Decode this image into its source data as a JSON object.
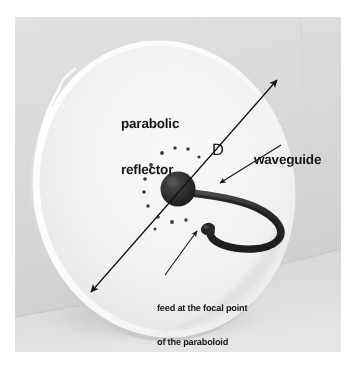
{
  "figure": {
    "kind": "photograph-with-annotations",
    "page_background": "#ffffff",
    "photo_background": "#dcdcdc",
    "dish_face_color": "#f1f1f1",
    "annotation_color": "#161616",
    "hardware_color": "#2a2a2a"
  },
  "labels": {
    "reflector": "parabolic\nreflector",
    "reflector_line1": "parabolic",
    "reflector_line2": "reflector",
    "diameter": "D",
    "waveguide": "waveguide",
    "feed_caption": "feed at the focal point\nof the paraboloid",
    "feed_caption_line1": "feed at the focal point",
    "feed_caption_line2": "of the paraboloid"
  },
  "annotations": {
    "diameter_arrow": {
      "name": "D",
      "style": "double-headed",
      "from": [
        90,
        290
      ],
      "to": [
        276,
        78
      ]
    },
    "waveguide_leader": {
      "style": "single-arrow",
      "from": [
        256,
        152
      ],
      "to": [
        216,
        180
      ]
    },
    "feed_leader": {
      "style": "single-arrow",
      "from": [
        218,
        258
      ],
      "to": [
        181,
        223
      ]
    }
  },
  "parts": {
    "dish": {
      "label": "parabolic reflector",
      "shape": "ellipse"
    },
    "hub": {
      "label": "central hub",
      "center": [
        178,
        188
      ]
    },
    "waveguide_tube": {
      "label": "waveguide",
      "shape": "curved tube"
    },
    "feed": {
      "label": "feed at the focal point of the paraboloid"
    },
    "fasteners": {
      "label": "rivets",
      "count": 12
    }
  }
}
